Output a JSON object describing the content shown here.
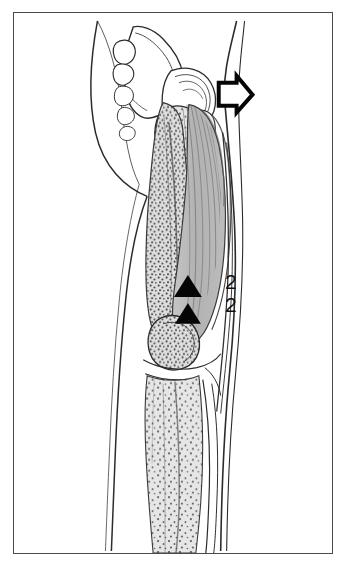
{
  "figure": {
    "view": "lateral",
    "background_color": "#ffffff",
    "frame_color": "#4a4a4a",
    "labels": [
      {
        "id": "label-2-upper",
        "text": "2"
      },
      {
        "id": "label-2-lower",
        "text": "2"
      }
    ],
    "markers": [
      {
        "name": "solid-arrowhead-upper",
        "shape": "filled-triangle-up",
        "color": "#050505",
        "x": 175,
        "y": 278
      },
      {
        "name": "solid-arrowhead-lower",
        "shape": "filled-triangle-up",
        "color": "#050505",
        "x": 175,
        "y": 305
      },
      {
        "name": "hollow-arrow-marker",
        "shape": "outlined-arrow-right",
        "color": "#050505",
        "x": 228,
        "y": 83
      }
    ],
    "regions": [
      {
        "name": "pelvis-bone",
        "fill": "#ffffff",
        "stroke": "#2b2b2b",
        "pattern": "outline"
      },
      {
        "name": "femoral-head-neck",
        "fill": "#f2f2f2",
        "stroke": "#2b2b2b",
        "pattern": "outline"
      },
      {
        "name": "quadriceps-muscle",
        "fill": "#b4b4b4",
        "stroke": "#3a3a3a",
        "pattern": "striated-fibers"
      },
      {
        "name": "femur-shaft-stippled",
        "fill": "#dcdcdc",
        "stroke": "#3a3a3a",
        "pattern": "stipple"
      },
      {
        "name": "tibia-stippled",
        "fill": "#e2e2e2",
        "stroke": "#3a3a3a",
        "pattern": "stipple"
      },
      {
        "name": "patella",
        "fill": "#d8d8d8",
        "stroke": "#2b2b2b",
        "pattern": "stipple"
      },
      {
        "name": "skin-contour",
        "fill": "none",
        "stroke": "#2b2b2b",
        "pattern": "outline"
      }
    ],
    "colors": {
      "ink": "#2b2b2b",
      "marker_black": "#050505",
      "muscle_gray": "#b4b4b4",
      "bone_gray": "#dcdcdc",
      "stipple_dot": "#555555"
    }
  }
}
